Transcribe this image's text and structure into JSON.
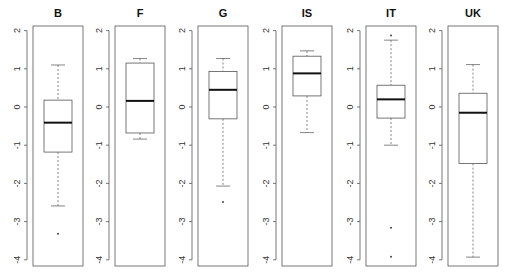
{
  "chart_data": {
    "type": "boxplot",
    "title": "",
    "xlabel": "",
    "ylabel": "",
    "ylim": [
      -4,
      2
    ],
    "yticks": [
      2,
      1,
      0,
      -1,
      -2,
      -3,
      -4
    ],
    "ytick_labels": [
      "2",
      "1",
      "0",
      "-1",
      "-2",
      "-3",
      "-4"
    ],
    "grid": false,
    "legend": null,
    "layout": "6 side-by-side panels, each with its own y-axis",
    "panels": [
      {
        "name": "B",
        "whisker_high": 1.1,
        "q3": 0.18,
        "median": -0.41,
        "q1": -1.18,
        "whisker_low": -2.59,
        "outliers": [
          -3.32
        ]
      },
      {
        "name": "F",
        "whisker_high": 1.27,
        "q3": 1.15,
        "median": 0.16,
        "q1": -0.68,
        "whisker_low": -0.84,
        "outliers": []
      },
      {
        "name": "G",
        "whisker_high": 1.27,
        "q3": 0.93,
        "median": 0.45,
        "q1": -0.31,
        "whisker_low": -2.07,
        "outliers": [
          -2.49
        ]
      },
      {
        "name": "IS",
        "whisker_high": 1.47,
        "q3": 1.33,
        "median": 0.88,
        "q1": 0.29,
        "whisker_low": -0.67,
        "outliers": []
      },
      {
        "name": "IT",
        "whisker_high": 1.75,
        "q3": 0.57,
        "median": 0.2,
        "q1": -0.29,
        "whisker_low": -1.0,
        "outliers": [
          1.87,
          -3.16,
          -3.92
        ]
      },
      {
        "name": "UK",
        "whisker_high": 1.11,
        "q3": 0.36,
        "median": -0.15,
        "q1": -1.48,
        "whisker_low": -3.93,
        "outliers": []
      }
    ]
  },
  "colors": {
    "frame": "#555555",
    "box": "#555555",
    "median": "#111111",
    "whisker": "#666666",
    "text": "#111111"
  }
}
